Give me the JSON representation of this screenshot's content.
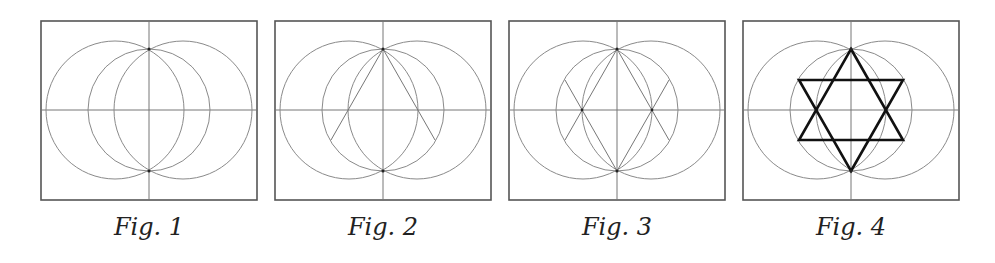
{
  "figures": [
    {
      "id": 1,
      "caption": "Fig. 1",
      "left": 40,
      "steps": [
        "axes",
        "outer-circles",
        "middle-circle"
      ]
    },
    {
      "id": 2,
      "caption": "Fig. 2",
      "left": 274,
      "steps": [
        "axes",
        "outer-circles",
        "middle-circle",
        "lines-from-top"
      ]
    },
    {
      "id": 3,
      "caption": "Fig. 3",
      "left": 508,
      "steps": [
        "axes",
        "outer-circles",
        "middle-circle",
        "lines-from-top",
        "lines-from-bottom"
      ]
    },
    {
      "id": 4,
      "caption": "Fig. 4",
      "left": 742,
      "steps": [
        "axes",
        "outer-circles",
        "middle-circle",
        "hexagram"
      ]
    }
  ],
  "geometry": {
    "box_width": 218,
    "box_height": 181,
    "center": [
      109,
      90
    ],
    "outer_circle_radius": 69,
    "outer_circle_offset": 34,
    "middle_circle_radius": 61,
    "hex_half_width": 52,
    "hex_half_height": 30
  },
  "colors": {
    "frame": "#555555",
    "construction": "#8a8a8a",
    "star": "#111111",
    "caption": "#222222"
  }
}
